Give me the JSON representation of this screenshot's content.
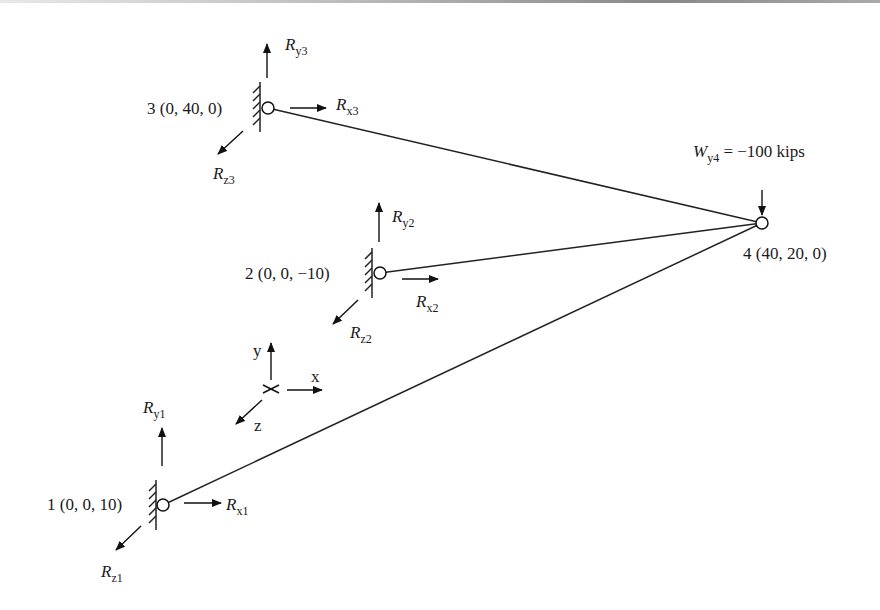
{
  "figure": {
    "nodes": [
      {
        "id": "1",
        "label": "1 (0, 0, 10)",
        "coords": [
          0,
          0,
          10
        ]
      },
      {
        "id": "2",
        "label": "2 (0, 0, −10)",
        "coords": [
          0,
          0,
          -10
        ]
      },
      {
        "id": "3",
        "label": "3 (0, 40, 0)",
        "coords": [
          0,
          40,
          0
        ]
      },
      {
        "id": "4",
        "label": "4 (40, 20, 0)",
        "coords": [
          40,
          20,
          0
        ]
      }
    ],
    "members": [
      {
        "from": "1",
        "to": "4"
      },
      {
        "from": "2",
        "to": "4"
      },
      {
        "from": "3",
        "to": "4"
      }
    ],
    "reactions": {
      "node1": {
        "x": {
          "main": "R",
          "sub": "x1"
        },
        "y": {
          "main": "R",
          "sub": "y1"
        },
        "z": {
          "main": "R",
          "sub": "z1"
        }
      },
      "node2": {
        "x": {
          "main": "R",
          "sub": "x2"
        },
        "y": {
          "main": "R",
          "sub": "y2"
        },
        "z": {
          "main": "R",
          "sub": "z2"
        }
      },
      "node3": {
        "x": {
          "main": "R",
          "sub": "x3"
        },
        "y": {
          "main": "R",
          "sub": "y3"
        },
        "z": {
          "main": "R",
          "sub": "z3"
        }
      }
    },
    "load": {
      "main": "W",
      "sub": "y4",
      "value": " = −100 kips"
    },
    "axes": {
      "x": "x",
      "y": "y",
      "z": "z"
    }
  }
}
